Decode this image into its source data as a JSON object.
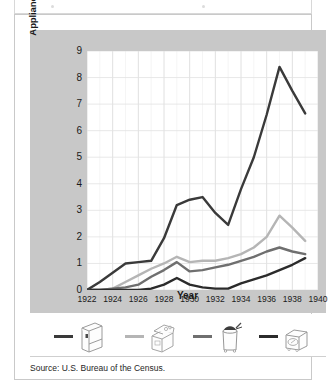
{
  "figure": {
    "source_note": "Source: U.S. Bureau of the Census.",
    "panel_bg": "#c8c8c8",
    "plot_bg": "#ffffff",
    "border_color": "#c9c9c9"
  },
  "chart_data": {
    "type": "line",
    "title": "",
    "xlabel": "Year",
    "ylabel": "Appliances produced (in millions)",
    "xlim": [
      1922,
      1940
    ],
    "ylim": [
      0,
      9
    ],
    "xticks": [
      "1922",
      "1924",
      "1926",
      "1928",
      "1930",
      "1932",
      "1934",
      "1936",
      "1938",
      "1940"
    ],
    "yticks": [
      "0",
      "1",
      "2",
      "3",
      "4",
      "5",
      "6",
      "7",
      "8",
      "9"
    ],
    "grid": "both-axes-minor-annual",
    "legend_position": "below-plot",
    "x": [
      1922,
      1923,
      1924,
      1925,
      1926,
      1927,
      1928,
      1929,
      1930,
      1931,
      1932,
      1933,
      1934,
      1935,
      1936,
      1937,
      1938,
      1939
    ],
    "series": [
      {
        "name": "refrigerator",
        "color": "#3a3a3a",
        "values": [
          0.0,
          0.3,
          0.65,
          1.0,
          1.05,
          1.1,
          1.95,
          3.2,
          3.4,
          3.5,
          2.9,
          2.45,
          3.8,
          5.0,
          6.6,
          8.4,
          7.5,
          6.65
        ]
      },
      {
        "name": "stove-range",
        "color": "#b5b5b5",
        "values": [
          0.0,
          0.0,
          0.05,
          0.3,
          0.55,
          0.8,
          1.0,
          1.25,
          1.05,
          1.1,
          1.1,
          1.2,
          1.35,
          1.6,
          2.0,
          2.8,
          2.35,
          1.85
        ]
      },
      {
        "name": "washing-machine",
        "color": "#6f6f6f",
        "values": [
          0.0,
          0.0,
          0.05,
          0.1,
          0.2,
          0.5,
          0.75,
          1.05,
          0.7,
          0.75,
          0.85,
          0.95,
          1.1,
          1.25,
          1.45,
          1.6,
          1.45,
          1.35
        ]
      },
      {
        "name": "vacuum-cleaner",
        "color": "#2b2b2b",
        "values": [
          0.0,
          0.0,
          0.0,
          0.0,
          0.0,
          0.05,
          0.2,
          0.45,
          0.2,
          0.1,
          0.05,
          0.05,
          0.25,
          0.4,
          0.55,
          0.75,
          0.95,
          1.2
        ]
      }
    ]
  },
  "legend": {
    "items": [
      {
        "icon": "refrigerator-icon",
        "swatch_color": "#3a3a3a"
      },
      {
        "icon": "stove-range-icon",
        "swatch_color": "#b5b5b5"
      },
      {
        "icon": "washing-machine-icon",
        "swatch_color": "#6f6f6f"
      },
      {
        "icon": "vacuum-cleaner-icon",
        "swatch_color": "#2b2b2b"
      }
    ]
  }
}
